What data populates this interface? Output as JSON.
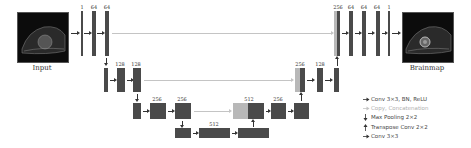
{
  "colors": {
    "feature_map": "#4a4a4a",
    "copied_feature_map": "#b8b8b8",
    "arrow": "#333333",
    "skip_connection": "#c4c4c4"
  },
  "input_image": {
    "label": "Input"
  },
  "output_image": {
    "label": "Brainmap"
  },
  "encoder": {
    "level1": [
      "1",
      "64",
      "64"
    ],
    "level2": [
      "128",
      "128"
    ],
    "level3": [
      "256",
      "256"
    ],
    "bottleneck": [
      "512"
    ]
  },
  "decoder": {
    "level3": [
      "512",
      "256"
    ],
    "level2": [
      "256",
      "128"
    ],
    "level1": [
      "256",
      "64",
      "64",
      "64",
      "1"
    ]
  },
  "legend": [
    {
      "icon": "arrow-right-icon",
      "label": "Conv 3×3, BN, ReLU"
    },
    {
      "icon": "arrow-right-light-icon",
      "label": "Copy, Concatenation"
    },
    {
      "icon": "arrow-down-icon",
      "label": "Max Pooling 2×2"
    },
    {
      "icon": "arrow-up-icon",
      "label": "Transpose Conv 2×2"
    },
    {
      "icon": "arrow-right-icon",
      "label": "Conv 3×3"
    }
  ]
}
